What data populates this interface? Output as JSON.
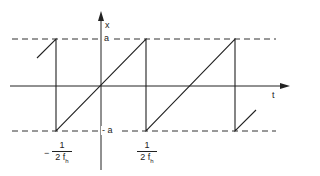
{
  "diagram": {
    "type": "sawtooth-waveform",
    "axes": {
      "x_axis_label": "t",
      "y_axis_label": "x"
    },
    "levels": {
      "upper_label": "a",
      "lower_label": "- a"
    },
    "ticks": [
      {
        "sign": "−",
        "numerator": "1",
        "denominator": "2 f",
        "subscript": "h"
      },
      {
        "sign": "",
        "numerator": "1",
        "denominator": "2 f",
        "subscript": "h"
      }
    ],
    "colors": {
      "line": "#222222",
      "background": "#ffffff"
    }
  }
}
